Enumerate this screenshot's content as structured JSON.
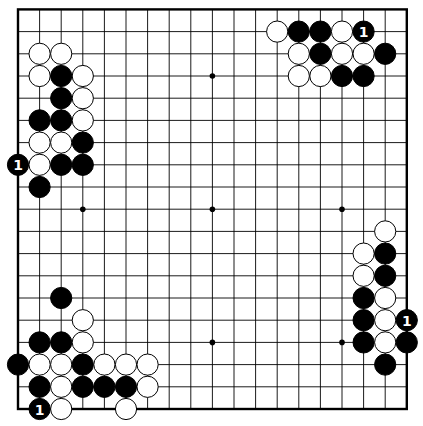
{
  "board": {
    "size": 19,
    "origin_x": 18,
    "origin_y": 9.4,
    "spacing_x": 21.6,
    "spacing_y": 22.2,
    "stone_radius": 10.6,
    "colors": {
      "background": "#ffffff",
      "line": "#000000",
      "black": "#000000",
      "white": "#ffffff"
    },
    "star_points": [
      [
        3,
        3
      ],
      [
        9,
        3
      ],
      [
        15,
        3
      ],
      [
        3,
        9
      ],
      [
        9,
        9
      ],
      [
        15,
        9
      ],
      [
        3,
        15
      ],
      [
        9,
        15
      ],
      [
        15,
        15
      ]
    ]
  },
  "stones": [
    {
      "col": 1,
      "row": 2,
      "color": "white"
    },
    {
      "col": 2,
      "row": 2,
      "color": "white"
    },
    {
      "col": 1,
      "row": 3,
      "color": "white"
    },
    {
      "col": 2,
      "row": 3,
      "color": "black"
    },
    {
      "col": 3,
      "row": 3,
      "color": "white"
    },
    {
      "col": 2,
      "row": 4,
      "color": "black"
    },
    {
      "col": 3,
      "row": 4,
      "color": "white"
    },
    {
      "col": 1,
      "row": 5,
      "color": "black"
    },
    {
      "col": 2,
      "row": 5,
      "color": "black"
    },
    {
      "col": 3,
      "row": 5,
      "color": "white"
    },
    {
      "col": 1,
      "row": 6,
      "color": "white"
    },
    {
      "col": 2,
      "row": 6,
      "color": "white"
    },
    {
      "col": 3,
      "row": 6,
      "color": "black"
    },
    {
      "col": 0,
      "row": 7,
      "color": "black",
      "label": "1"
    },
    {
      "col": 1,
      "row": 7,
      "color": "white"
    },
    {
      "col": 2,
      "row": 7,
      "color": "black"
    },
    {
      "col": 3,
      "row": 7,
      "color": "black"
    },
    {
      "col": 1,
      "row": 8,
      "color": "black"
    },
    {
      "col": 12,
      "row": 1,
      "color": "white"
    },
    {
      "col": 13,
      "row": 1,
      "color": "black"
    },
    {
      "col": 14,
      "row": 1,
      "color": "black"
    },
    {
      "col": 15,
      "row": 1,
      "color": "white"
    },
    {
      "col": 16,
      "row": 1,
      "color": "black",
      "label": "1"
    },
    {
      "col": 13,
      "row": 2,
      "color": "white"
    },
    {
      "col": 14,
      "row": 2,
      "color": "black"
    },
    {
      "col": 15,
      "row": 2,
      "color": "white"
    },
    {
      "col": 16,
      "row": 2,
      "color": "white"
    },
    {
      "col": 17,
      "row": 2,
      "color": "black"
    },
    {
      "col": 13,
      "row": 3,
      "color": "white"
    },
    {
      "col": 14,
      "row": 3,
      "color": "white"
    },
    {
      "col": 15,
      "row": 3,
      "color": "black"
    },
    {
      "col": 16,
      "row": 3,
      "color": "black"
    },
    {
      "col": 17,
      "row": 10,
      "color": "white"
    },
    {
      "col": 16,
      "row": 11,
      "color": "white"
    },
    {
      "col": 17,
      "row": 11,
      "color": "black"
    },
    {
      "col": 16,
      "row": 12,
      "color": "white"
    },
    {
      "col": 17,
      "row": 12,
      "color": "black"
    },
    {
      "col": 16,
      "row": 13,
      "color": "black"
    },
    {
      "col": 17,
      "row": 13,
      "color": "white"
    },
    {
      "col": 16,
      "row": 14,
      "color": "black"
    },
    {
      "col": 17,
      "row": 14,
      "color": "white"
    },
    {
      "col": 18,
      "row": 14,
      "color": "black",
      "label": "1"
    },
    {
      "col": 16,
      "row": 15,
      "color": "black"
    },
    {
      "col": 17,
      "row": 15,
      "color": "white"
    },
    {
      "col": 18,
      "row": 15,
      "color": "black"
    },
    {
      "col": 17,
      "row": 16,
      "color": "black"
    },
    {
      "col": 2,
      "row": 13,
      "color": "black"
    },
    {
      "col": 3,
      "row": 14,
      "color": "white"
    },
    {
      "col": 1,
      "row": 15,
      "color": "black"
    },
    {
      "col": 2,
      "row": 15,
      "color": "black"
    },
    {
      "col": 3,
      "row": 15,
      "color": "white"
    },
    {
      "col": 0,
      "row": 16,
      "color": "black"
    },
    {
      "col": 1,
      "row": 16,
      "color": "white"
    },
    {
      "col": 2,
      "row": 16,
      "color": "white"
    },
    {
      "col": 3,
      "row": 16,
      "color": "black"
    },
    {
      "col": 4,
      "row": 16,
      "color": "white"
    },
    {
      "col": 5,
      "row": 16,
      "color": "white"
    },
    {
      "col": 6,
      "row": 16,
      "color": "white"
    },
    {
      "col": 1,
      "row": 17,
      "color": "black"
    },
    {
      "col": 2,
      "row": 17,
      "color": "white"
    },
    {
      "col": 3,
      "row": 17,
      "color": "black"
    },
    {
      "col": 4,
      "row": 17,
      "color": "black"
    },
    {
      "col": 5,
      "row": 17,
      "color": "black"
    },
    {
      "col": 6,
      "row": 17,
      "color": "white"
    },
    {
      "col": 1,
      "row": 18,
      "color": "black",
      "label": "1"
    },
    {
      "col": 2,
      "row": 18,
      "color": "white"
    },
    {
      "col": 5,
      "row": 18,
      "color": "white"
    }
  ]
}
